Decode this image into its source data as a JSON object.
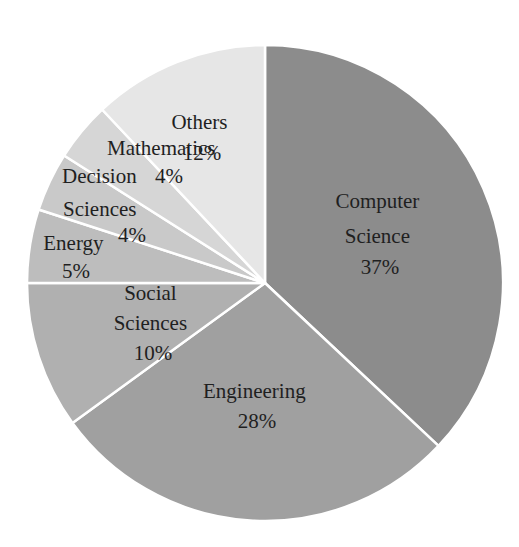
{
  "chart_data": {
    "type": "pie",
    "title": "",
    "start_angle_deg": 0,
    "direction": "clockwise",
    "categories": [
      "Computer Science",
      "Engineering",
      "Social Sciences",
      "Energy",
      "Decision Sciences",
      "Mathematics",
      "Others"
    ],
    "values": [
      37,
      28,
      10,
      5,
      4,
      4,
      12
    ],
    "unit": "%",
    "colors": [
      "#8c8c8c",
      "#a0a0a0",
      "#b0b0b0",
      "#bdbdbd",
      "#c9c9c9",
      "#d6d6d6",
      "#e6e6e6"
    ],
    "slice_border_color": "#ffffff",
    "legend": "none",
    "labels": [
      {
        "lines": [
          "Computer",
          "Science",
          "37%"
        ]
      },
      {
        "lines": [
          "Engineering",
          "28%"
        ]
      },
      {
        "lines": [
          "Social",
          "Sciences",
          "10%"
        ]
      },
      {
        "lines": [
          "Energy",
          "5%"
        ]
      },
      {
        "lines": [
          "Decision",
          "Sciences",
          "4%"
        ]
      },
      {
        "lines": [
          "Mathematics",
          "4%"
        ]
      },
      {
        "lines": [
          "Others",
          "12%"
        ]
      }
    ]
  }
}
